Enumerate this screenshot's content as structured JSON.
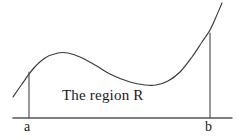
{
  "figure": {
    "caption": "The region R",
    "left_bound_label": "a",
    "right_bound_label": "b",
    "background_color": "#ffffff",
    "ink_color": "#3a3a3a",
    "text_color": "#1a1a1a"
  },
  "chart_data": {
    "type": "line",
    "title": "The region R",
    "xlabel": "",
    "ylabel": "",
    "grid": false,
    "legend": null,
    "axis": {
      "x_axis_drawn": true,
      "y_axis_drawn": false,
      "x_axis_y_pixel": 118,
      "x_axis_x_start": 13,
      "x_axis_x_end": 232
    },
    "annotations": [
      {
        "text": "The region R",
        "x": 62,
        "y": 100
      },
      {
        "text": "a",
        "x": 28,
        "y": 128
      },
      {
        "text": "b",
        "x": 209,
        "y": 128
      }
    ],
    "bounds": {
      "a_x_pixel": 29,
      "b_x_pixel": 210,
      "a_curve_y_pixel": 72,
      "b_curve_y_pixel": 33
    },
    "curve_path_points": [
      [
        13,
        97
      ],
      [
        22,
        84
      ],
      [
        33,
        69
      ],
      [
        45,
        58
      ],
      [
        58,
        53
      ],
      [
        68,
        53
      ],
      [
        80,
        57
      ],
      [
        95,
        65
      ],
      [
        112,
        75
      ],
      [
        130,
        82
      ],
      [
        145,
        85
      ],
      [
        156,
        85
      ],
      [
        168,
        81
      ],
      [
        180,
        72
      ],
      [
        192,
        57
      ],
      [
        202,
        42
      ],
      [
        210,
        30
      ],
      [
        216,
        17
      ],
      [
        222,
        3
      ]
    ],
    "verticals": [
      {
        "label": "a",
        "x": 29,
        "y_top": 72,
        "y_bottom": 118
      },
      {
        "label": "b",
        "x": 210,
        "y_top": 33,
        "y_bottom": 118
      }
    ]
  }
}
